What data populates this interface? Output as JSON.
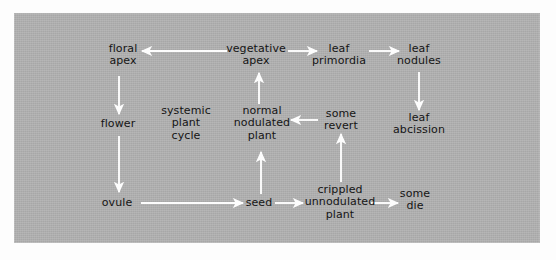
{
  "figure": {
    "panel_color": "#b1b1b1",
    "background_color": "#fdfdfd",
    "arrow_color": "#fdfdfd",
    "text_color": "#141414"
  },
  "nodes": [
    {
      "id": "floral_apex",
      "label": "floral\napex",
      "x": 123,
      "y": 55
    },
    {
      "id": "vegetative_apex",
      "label": "vegetative\napex",
      "x": 256,
      "y": 55
    },
    {
      "id": "leaf_primordia",
      "label": "leaf\nprimordia",
      "x": 339,
      "y": 55
    },
    {
      "id": "leaf_nodules",
      "label": "leaf\nnodules",
      "x": 419,
      "y": 55
    },
    {
      "id": "flower",
      "label": "flower",
      "x": 118,
      "y": 124
    },
    {
      "id": "normal_nodulated",
      "label": "normal\nnodulated\nplant",
      "x": 262,
      "y": 124
    },
    {
      "id": "some_revert",
      "label": "some\nrevert",
      "x": 341,
      "y": 120
    },
    {
      "id": "leaf_abcission",
      "label": "leaf\nabcission",
      "x": 419,
      "y": 124
    },
    {
      "id": "ovule",
      "label": "ovule",
      "x": 117,
      "y": 203
    },
    {
      "id": "seed",
      "label": "seed",
      "x": 259,
      "y": 203
    },
    {
      "id": "crippled_plant",
      "label": "crippled\nunnodulated\nplant",
      "x": 340,
      "y": 203
    },
    {
      "id": "some_die",
      "label": "some\ndie",
      "x": 415,
      "y": 200
    }
  ],
  "free_labels": [
    {
      "id": "systemic_plant_cycle",
      "label": "systemic\nplant\ncycle",
      "x": 186,
      "y": 124
    }
  ],
  "edges": [
    {
      "id": "vegetative-to-floral",
      "from": "vegetative_apex",
      "to": "floral_apex",
      "x1": 227,
      "y1": 51,
      "x2": 142,
      "y2": 51
    },
    {
      "id": "vegetative-to-primordia",
      "from": "vegetative_apex",
      "to": "leaf_primordia",
      "x1": 288,
      "y1": 51,
      "x2": 317,
      "y2": 51
    },
    {
      "id": "primordia-to-nodules",
      "from": "leaf_primordia",
      "to": "leaf_nodules",
      "x1": 369,
      "y1": 51,
      "x2": 399,
      "y2": 51
    },
    {
      "id": "nodules-to-abcission",
      "from": "leaf_nodules",
      "to": "leaf_abcission",
      "x1": 419,
      "y1": 72,
      "x2": 419,
      "y2": 110
    },
    {
      "id": "floral-to-flower",
      "from": "floral_apex",
      "to": "flower",
      "x1": 119,
      "y1": 76,
      "x2": 119,
      "y2": 114
    },
    {
      "id": "flower-to-ovule",
      "from": "flower",
      "to": "ovule",
      "x1": 119,
      "y1": 136,
      "x2": 119,
      "y2": 192
    },
    {
      "id": "ovule-to-seed",
      "from": "ovule",
      "to": "seed",
      "x1": 141,
      "y1": 203,
      "x2": 243,
      "y2": 203
    },
    {
      "id": "seed-to-normal",
      "from": "seed",
      "to": "normal_nodulated",
      "x1": 261,
      "y1": 194,
      "x2": 261,
      "y2": 152
    },
    {
      "id": "normal-to-vegetative",
      "from": "normal_nodulated",
      "to": "vegetative_apex",
      "x1": 259,
      "y1": 104,
      "x2": 259,
      "y2": 73
    },
    {
      "id": "seed-to-crippled",
      "from": "seed",
      "to": "crippled_plant",
      "x1": 275,
      "y1": 203,
      "x2": 303,
      "y2": 203
    },
    {
      "id": "crippled-to-revert",
      "from": "crippled_plant",
      "to": "some_revert",
      "x1": 341,
      "y1": 182,
      "x2": 341,
      "y2": 134
    },
    {
      "id": "revert-to-normal",
      "from": "some_revert",
      "to": "normal_nodulated",
      "x1": 318,
      "y1": 120,
      "x2": 291,
      "y2": 120
    },
    {
      "id": "crippled-to-die",
      "from": "crippled_plant",
      "to": "some_die",
      "x1": 371,
      "y1": 203,
      "x2": 398,
      "y2": 203
    }
  ]
}
